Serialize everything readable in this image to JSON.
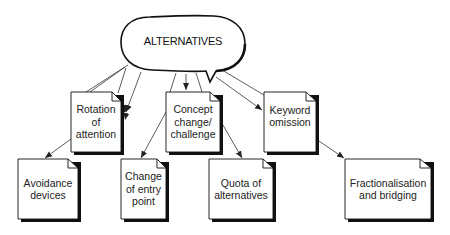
{
  "diagram": {
    "root": {
      "label": "ALTERNATIVES"
    },
    "nodes": [
      {
        "id": "rotation",
        "label_lines": [
          "Rotation",
          "of",
          "attention"
        ]
      },
      {
        "id": "concept",
        "label_lines": [
          "Concept",
          "change/",
          "challenge"
        ]
      },
      {
        "id": "keyword",
        "label_lines": [
          "Keyword",
          "omission"
        ]
      },
      {
        "id": "avoidance",
        "label_lines": [
          "Avoidance",
          "devices"
        ]
      },
      {
        "id": "entry",
        "label_lines": [
          "Change",
          "of entry",
          "point"
        ]
      },
      {
        "id": "quota",
        "label_lines": [
          "Quota of",
          "alternatives"
        ]
      },
      {
        "id": "fraction",
        "label_lines": [
          "Fractionalisation",
          "and bridging"
        ]
      }
    ],
    "edges": [
      {
        "from": "ALTERNATIVES",
        "to": "rotation",
        "style": "double"
      },
      {
        "from": "ALTERNATIVES",
        "to": "concept",
        "style": "double"
      },
      {
        "from": "ALTERNATIVES",
        "to": "keyword",
        "style": "double"
      },
      {
        "from": "rotation",
        "to": "avoidance"
      },
      {
        "from": "concept",
        "to": "entry"
      },
      {
        "from": "concept",
        "to": "quota"
      },
      {
        "from": "keyword",
        "to": "fraction"
      }
    ]
  }
}
